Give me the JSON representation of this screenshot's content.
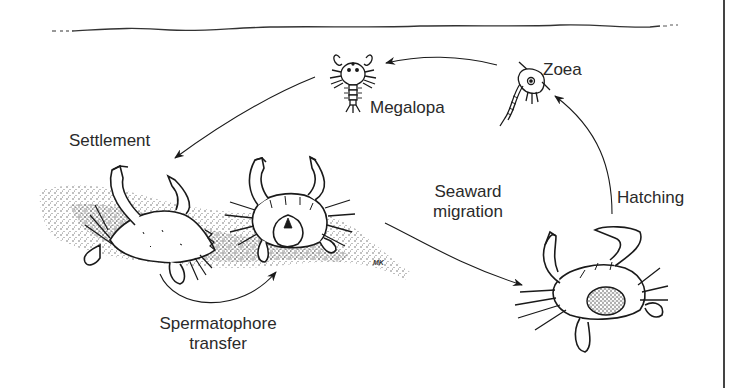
{
  "diagram": {
    "labels": {
      "megalopa": "Megalopa",
      "zoea": "Zoea",
      "settlement": "Settlement",
      "hatching": "Hatching",
      "seaward_migration_line1": "Seaward",
      "seaward_migration_line2": "migration",
      "spermatophore_line1": "Spermatophore",
      "spermatophore_line2": "transfer",
      "artist_initials": "MK"
    },
    "stages": [
      {
        "id": "zoea",
        "label": "Zoea",
        "depicted": "larval zoea"
      },
      {
        "id": "megalopa",
        "label": "Megalopa",
        "depicted": "postlarval megalopa"
      },
      {
        "id": "juvenile-adult",
        "depicted": "crabs on sandy bottom (mating pair)"
      },
      {
        "id": "female",
        "depicted": "egg-bearing (sponge) female crab"
      }
    ],
    "transitions": [
      {
        "from": "zoea",
        "to": "megalopa",
        "label": ""
      },
      {
        "from": "megalopa",
        "to": "settled-crab",
        "label": "Settlement"
      },
      {
        "from": "male",
        "to": "female",
        "label": "Spermatophore transfer"
      },
      {
        "from": "mated-female",
        "to": "egg-bearing-female",
        "label": "Seaward migration"
      },
      {
        "from": "egg-bearing-female",
        "to": "zoea",
        "label": "Hatching"
      }
    ],
    "colors": {
      "ink": "#1a1a1a",
      "background": "#ffffff",
      "text": "#2a2a2a"
    }
  }
}
